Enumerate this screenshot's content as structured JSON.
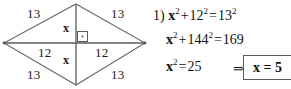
{
  "figure": {
    "shape_name": "rhombus",
    "vertices": {
      "top": {
        "x": 76,
        "y": 4
      },
      "right": {
        "x": 145,
        "y": 43
      },
      "bottom": {
        "x": 76,
        "y": 85
      },
      "left": {
        "x": 4,
        "y": 43
      }
    },
    "stroke_color": "#6b6b6b",
    "diagonal_color": "#5a5a5a",
    "right_angle_marker": "right-angle-square-with-dot",
    "labels": {
      "side_top_left": "13",
      "side_top_right": "13",
      "side_bottom_left": "13",
      "side_bottom_right": "13",
      "diagonal_half_left": "12",
      "diagonal_half_right": "12",
      "vertical_half_top": "x",
      "vertical_half_bottom": "x"
    }
  },
  "solution": {
    "problem_number": "1)",
    "line1": {
      "lhs_var": "x",
      "lhs_exp": "2",
      "plus": "+",
      "term2_base": "12",
      "term2_exp": "2",
      "equals": "=",
      "rhs_base": "13",
      "rhs_exp": "2",
      "plain": "1) x² + 12² = 13²"
    },
    "line2": {
      "lhs_var": "x",
      "lhs_exp": "2",
      "plus": "+",
      "term2_base": "144",
      "term2_exp": "2",
      "equals": "=",
      "rhs": "169",
      "plain": "x² + 144² = 169"
    },
    "line3": {
      "lhs_var": "x",
      "lhs_exp": "2",
      "equals": "=",
      "rhs": "25",
      "plain": "x² = 25"
    },
    "implies_symbol": "⇒",
    "answer": "x = 5",
    "answer_box_color": "#595959"
  }
}
